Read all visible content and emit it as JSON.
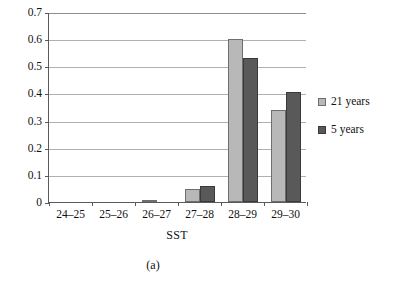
{
  "figure": {
    "caption": "(a)"
  },
  "chart_data": {
    "type": "bar",
    "title": "",
    "xlabel": "SST",
    "ylabel": "",
    "categories": [
      "24–25",
      "25–26",
      "26–27",
      "27–28",
      "28–29",
      "29–30"
    ],
    "series": [
      {
        "name": "21 years",
        "color": "#b8b8b8",
        "values": [
          0,
          0,
          0.008,
          0.048,
          0.601,
          0.338
        ]
      },
      {
        "name": "5 years",
        "color": "#595959",
        "values": [
          0,
          0,
          0,
          0.06,
          0.53,
          0.405
        ]
      }
    ],
    "ylim": [
      0,
      0.7
    ],
    "ytick_labels": [
      "0",
      "0.1",
      "0.2",
      "0.3",
      "0.4",
      "0.5",
      "0.6",
      "0.7"
    ],
    "ytick_values": [
      0,
      0.1,
      0.2,
      0.3,
      0.4,
      0.5,
      0.6,
      0.7
    ],
    "grid": true,
    "grid_axis": "y",
    "legend_position": "right",
    "bar_edge_color_light": "#6e6e6e",
    "bar_edge_color_dark": "#3a3a3a",
    "axis_color": "#5a5a5a",
    "gridline_color": "#b0b0b0"
  }
}
